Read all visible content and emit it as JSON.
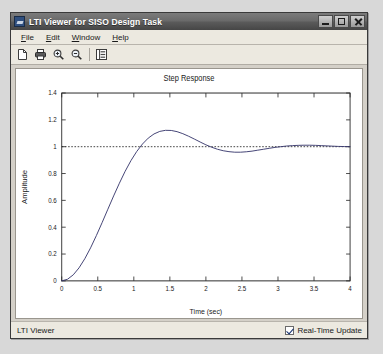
{
  "window": {
    "title": "LTI Viewer for SISO Design Task",
    "app_icon": "matlab-lti-icon",
    "controls": {
      "minimize": "Minimize",
      "maximize": "Maximize",
      "close": "Close"
    }
  },
  "menubar": {
    "items": [
      {
        "label": "File",
        "mnemonic": "F"
      },
      {
        "label": "Edit",
        "mnemonic": "E"
      },
      {
        "label": "Window",
        "mnemonic": "W"
      },
      {
        "label": "Help",
        "mnemonic": "H"
      }
    ]
  },
  "toolbar": {
    "buttons": [
      {
        "name": "new-document-icon",
        "tooltip": "New"
      },
      {
        "name": "print-icon",
        "tooltip": "Print"
      },
      {
        "name": "zoom-in-icon",
        "tooltip": "Zoom In"
      },
      {
        "name": "zoom-out-icon",
        "tooltip": "Zoom Out"
      },
      {
        "name": "properties-icon",
        "tooltip": "Properties"
      }
    ]
  },
  "statusbar": {
    "text": "LTI Viewer",
    "realtime_label": "Real-Time Update",
    "realtime_checked": true
  },
  "colors": {
    "titlebar_dark": "#464646",
    "titlebar_light": "#7b7b7b",
    "window_face": "#d4d0c8",
    "panel_face": "#ece9e0",
    "plot_background": "#ffffff",
    "curve": "#3a3a6e",
    "reference_line": "#202020",
    "axis": "#2a2a2a"
  },
  "chart_data": {
    "type": "line",
    "title": "Step Response",
    "xlabel": "Time (sec)",
    "ylabel": "Amplitude",
    "xlim": [
      0,
      4
    ],
    "ylim": [
      0,
      1.4
    ],
    "xticks": [
      0,
      0.5,
      1,
      1.5,
      2,
      2.5,
      3,
      3.5,
      4
    ],
    "xticklabels": [
      "0",
      "0.5",
      "1",
      "1.5",
      "2",
      "2.5",
      "3",
      "3.5",
      "4"
    ],
    "yticks": [
      0,
      0.2,
      0.4,
      0.6,
      0.8,
      1,
      1.2,
      1.4
    ],
    "yticklabels": [
      "0",
      "0.2",
      "0.4",
      "0.6",
      "0.8",
      "1",
      "1.2",
      "1.4"
    ],
    "grid": false,
    "legend": null,
    "reference_line": {
      "y": 1,
      "style": "dotted",
      "label": "Final value"
    },
    "series": [
      {
        "name": "Step Response",
        "style": "solid",
        "peak_value": 1.21,
        "peak_time": 1.06,
        "undershoot_value": 0.96,
        "undershoot_time": 2.1,
        "settling_value": 1.0,
        "x": [
          0,
          0.08,
          0.16,
          0.24,
          0.32,
          0.4,
          0.48,
          0.56,
          0.64,
          0.72,
          0.8,
          0.88,
          0.96,
          1.04,
          1.12,
          1.2,
          1.28,
          1.36,
          1.44,
          1.52,
          1.6,
          1.68,
          1.76,
          1.84,
          1.92,
          2.0,
          2.08,
          2.16,
          2.24,
          2.32,
          2.4,
          2.48,
          2.56,
          2.64,
          2.72,
          2.8,
          2.88,
          2.96,
          3.04,
          3.12,
          3.2,
          3.28,
          3.36,
          3.44,
          3.52,
          3.6,
          3.68,
          3.76,
          3.84,
          3.92,
          4.0
        ],
        "y": [
          0,
          0.012,
          0.045,
          0.097,
          0.165,
          0.246,
          0.337,
          0.434,
          0.534,
          0.633,
          0.728,
          0.817,
          0.896,
          0.964,
          1.02,
          1.064,
          1.095,
          1.114,
          1.122,
          1.121,
          1.112,
          1.097,
          1.078,
          1.057,
          1.035,
          1.014,
          0.996,
          0.981,
          0.97,
          0.963,
          0.959,
          0.959,
          0.962,
          0.967,
          0.974,
          0.981,
          0.988,
          0.995,
          1.0,
          1.005,
          1.008,
          1.01,
          1.011,
          1.011,
          1.01,
          1.008,
          1.006,
          1.004,
          1.002,
          1.001,
          1.0
        ]
      }
    ]
  }
}
